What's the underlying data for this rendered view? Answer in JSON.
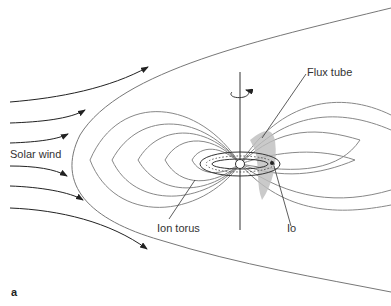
{
  "figure": {
    "panel_label": "a",
    "labels": {
      "solar_wind": "Solar wind",
      "flux_tube": "Flux tube",
      "ion_torus": "Ion torus",
      "io": "Io"
    },
    "colors": {
      "field_lines": "#7a7a7a",
      "arrows": "#222222",
      "flux_tube_fill": "#b8b8b8",
      "background": "#ffffff"
    }
  }
}
